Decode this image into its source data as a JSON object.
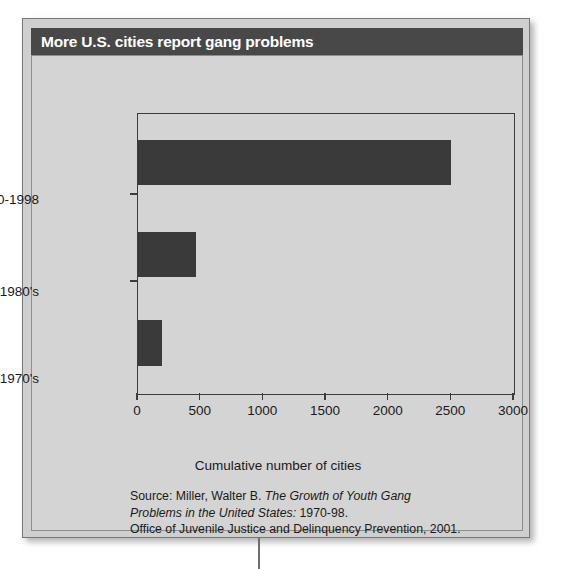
{
  "title": "More U.S. cities report gang problems",
  "chart_data": {
    "type": "bar",
    "orientation": "horizontal",
    "title": "More U.S. cities report gang problems",
    "categories": [
      "1990-1998",
      "1980's",
      "1970's"
    ],
    "values": [
      2500,
      465,
      190
    ],
    "xlabel": "Cumulative number of cities",
    "ylabel": "",
    "xlim": [
      0,
      3000
    ],
    "xticks": [
      "0",
      "500",
      "1000",
      "1500",
      "2000",
      "2500",
      "3000"
    ],
    "xtick_values": [
      0,
      500,
      1000,
      1500,
      2000,
      2500,
      3000
    ],
    "grid": false,
    "legend": false,
    "bar_color": "#3a3a3a",
    "plot_background": "#d4d4d4"
  },
  "caption": {
    "line1_prefix": "Source: Miller, Walter B. ",
    "line1_italic": "The Growth of Youth Gang",
    "line2_italic": "Problems in the United States:",
    "line2_suffix": " 1970-98.",
    "line3": "Office of Juvenile Justice and Delinquency Prevention, 2001."
  },
  "colors": {
    "title_bar": "#484848",
    "title_text": "#ffffff",
    "bar": "#3a3a3a",
    "card_background": "#cfcfcf",
    "panel_background": "#d4d4d4",
    "axis": "#3c3c3c"
  }
}
